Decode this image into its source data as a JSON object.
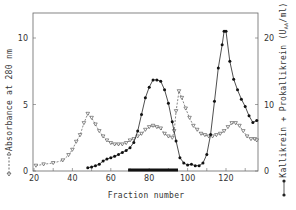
{
  "chart_data": {
    "type": "line",
    "title": "",
    "xlabel": "Fraction number",
    "ylabel": "Absorbance at 280 nm",
    "ylabel_right": "Kallikrein + Prokallikrein (U_AA/ml)",
    "xlim": [
      20,
      137
    ],
    "ylim": [
      0,
      11.9
    ],
    "ylim_right": [
      0,
      23.8
    ],
    "x_ticks": [
      20,
      40,
      60,
      80,
      100,
      120
    ],
    "y_ticks": [
      0,
      5,
      10
    ],
    "y_ticks_right": [
      0,
      10,
      20
    ],
    "grid": false,
    "legend_position": "axis-label symbols (left: open triangle dashed; right: filled circle solid)",
    "series": [
      {
        "name": "Absorbance at 280 nm",
        "axis": "left",
        "marker": "open-triangle",
        "line": "dashed",
        "x": [
          21,
          25,
          30,
          35,
          38,
          40,
          42,
          44,
          46,
          48,
          50,
          52,
          54,
          56,
          58,
          60,
          62,
          64,
          66,
          68,
          70,
          72,
          74,
          76,
          78,
          80,
          82,
          84,
          86,
          88,
          90,
          92,
          93,
          94,
          95.5,
          97,
          99,
          101,
          103,
          105,
          107,
          109,
          111,
          113,
          115,
          117,
          119,
          121,
          123,
          125,
          127,
          129,
          131,
          133,
          135,
          136
        ],
        "y": [
          0.4,
          0.5,
          0.6,
          0.8,
          1.2,
          1.6,
          2.2,
          2.7,
          3.6,
          4.3,
          4.0,
          3.5,
          3.0,
          2.6,
          2.3,
          2.1,
          2.0,
          2.0,
          2.0,
          2.1,
          2.3,
          2.4,
          2.6,
          2.8,
          3.1,
          3.3,
          3.4,
          3.3,
          3.2,
          2.8,
          2.6,
          2.5,
          3.0,
          4.5,
          6.0,
          5.5,
          4.7,
          4.0,
          3.4,
          3.1,
          2.8,
          2.7,
          2.6,
          2.6,
          2.7,
          2.8,
          3.0,
          3.3,
          3.6,
          3.6,
          3.4,
          3.0,
          2.6,
          2.4,
          2.4,
          2.3
        ]
      },
      {
        "name": "Kallikrein + Prokallikrein (U_AA/ml)",
        "axis": "right",
        "marker": "filled-circle",
        "line": "solid",
        "x": [
          48,
          50,
          52,
          54,
          56,
          58,
          60,
          62,
          64,
          66,
          68,
          70,
          72,
          74,
          76,
          78,
          80,
          82,
          84,
          86,
          88,
          90,
          92,
          94,
          96,
          98,
          100,
          102,
          104,
          106,
          108,
          110,
          112,
          114,
          116,
          118,
          119,
          120,
          122,
          124,
          126,
          128,
          130,
          132,
          134,
          136
        ],
        "y": [
          0.5,
          0.6,
          0.8,
          1.0,
          1.5,
          1.8,
          2.0,
          2.2,
          2.5,
          2.8,
          3.1,
          3.5,
          4.3,
          6.0,
          8.5,
          11.0,
          12.6,
          13.7,
          13.7,
          13.5,
          12.2,
          10.2,
          7.4,
          4.5,
          2.0,
          1.2,
          0.9,
          1.0,
          0.8,
          0.8,
          1.2,
          2.5,
          5.5,
          10.5,
          15.5,
          19.0,
          21.0,
          21.0,
          16.5,
          13.8,
          12.2,
          10.8,
          9.7,
          8.3,
          7.3,
          7.6
        ]
      }
    ],
    "annotations": [
      {
        "type": "horizontal-bar",
        "x_start": 69,
        "x_end": 95,
        "y": 0,
        "description": "pooled fractions"
      }
    ]
  },
  "labels": {
    "xlabel": "Fraction number",
    "ylabel_left": "Absorbance at 280 nm",
    "ylabel_right_main": "Kallikrein + Prokallikrein (U",
    "ylabel_right_sub": "AA",
    "ylabel_right_end": "/ml)"
  },
  "colors": {
    "axis": "#555555",
    "line": "#222222",
    "text": "#333333"
  }
}
